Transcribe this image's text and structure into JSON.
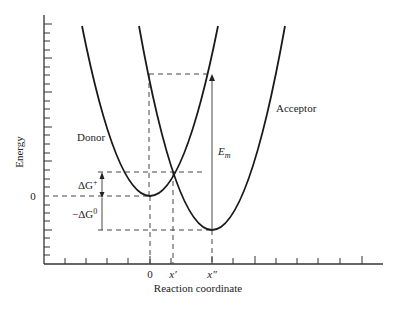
{
  "diagram": {
    "type": "marcus-parabolas",
    "axes": {
      "y_label": "Energy",
      "x_label": "Reaction coordinate",
      "y_zero_label": "0",
      "y_tick_count": 18,
      "x_tick_count": 13
    },
    "x_markers": [
      {
        "label": "0",
        "x": 150
      },
      {
        "label": "x′",
        "x": 173
      },
      {
        "label": "x″",
        "x": 212
      }
    ],
    "curves": [
      {
        "name": "Donor",
        "label": "Donor",
        "vertex_x": 150,
        "vertex_y": 196
      },
      {
        "name": "Acceptor",
        "label": "Acceptor",
        "vertex_x": 212,
        "vertex_y": 230
      }
    ],
    "annotations": {
      "delta_g_activation": "ΔG",
      "delta_g_activation_sup": "+",
      "neg_delta_g0": "−ΔG",
      "neg_delta_g0_sup": "0",
      "reorganization_energy": "E",
      "reorganization_energy_sub": "m"
    },
    "colors": {
      "curve": "#1a1a1a",
      "axis": "#333333",
      "dashed": "#444444"
    }
  }
}
